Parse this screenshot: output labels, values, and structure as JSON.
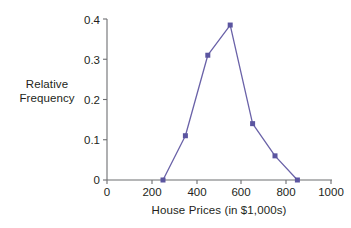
{
  "chart_data": {
    "type": "line",
    "title": "",
    "subtitle": "",
    "xlabel": "House Prices (in $1,000s)",
    "ylabel": "Relative Frequency",
    "ylabel_line1": "Relative",
    "ylabel_line2": "Frequency",
    "x": [
      250,
      350,
      450,
      550,
      650,
      750,
      850
    ],
    "values": [
      0,
      0.11,
      0.31,
      0.385,
      0.14,
      0.06,
      0
    ],
    "series": [
      {
        "name": "Relative Frequency",
        "x": [
          250,
          350,
          450,
          550,
          650,
          750,
          850
        ],
        "values": [
          0,
          0.11,
          0.31,
          0.385,
          0.14,
          0.06,
          0
        ]
      }
    ],
    "xlim": [
      0,
      1000
    ],
    "ylim": [
      0,
      0.4
    ],
    "xticks": [
      0,
      200,
      400,
      600,
      800,
      1000
    ],
    "yticks": [
      0,
      0.1,
      0.2,
      0.3,
      0.4
    ],
    "xtick_labels": [
      "0",
      "200",
      "400",
      "600",
      "800",
      "1000"
    ],
    "ytick_labels": [
      "0",
      "0.1",
      "0.2",
      "0.3",
      "0.4"
    ],
    "grid": false,
    "legend": false,
    "legend_position": "none",
    "marker": "square",
    "line_color": "#6a62a8",
    "marker_color": "#5b55a0",
    "axis_color": "#6d6e71",
    "text_color": "#231f20",
    "background": "#ffffff"
  }
}
